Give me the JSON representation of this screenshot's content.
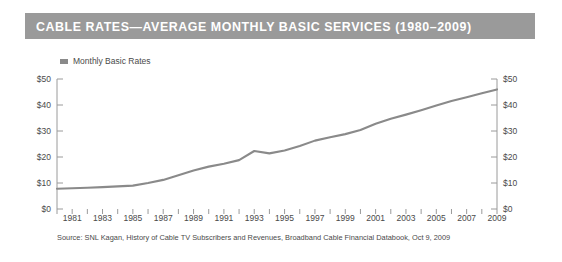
{
  "header": {
    "title": "CABLE RATES—AVERAGE MONTHLY BASIC SERVICES (1980–2009)",
    "band_color": "#9a9a9a",
    "title_color": "#ffffff"
  },
  "legend": {
    "position": "top-left",
    "entries": [
      {
        "label": "Monthly Basic Rates",
        "color": "#8a8a8a",
        "marker": "square"
      }
    ]
  },
  "source": {
    "text": "Source: SNL Kagan, History of Cable TV Subscribers and Revenues, Broadband Cable Financial Databook, Oct 9, 2009"
  },
  "axes": {
    "y_left_ticks": [
      "$50",
      "$40",
      "$30",
      "$20",
      "$10",
      "$0"
    ],
    "y_right_ticks": [
      "$50",
      "$40",
      "$30",
      "$20",
      "$10",
      "$0"
    ],
    "x_labels": [
      "1981",
      "1983",
      "1985",
      "1987",
      "1989",
      "1991",
      "1993",
      "1995",
      "1997",
      "1999",
      "2001",
      "2003",
      "2005",
      "2007",
      "2009"
    ]
  },
  "chart_data": {
    "type": "line",
    "title": "CABLE RATES—AVERAGE MONTHLY BASIC SERVICES (1980–2009)",
    "xlabel": "",
    "ylabel": "",
    "ylim": [
      0,
      50
    ],
    "xlim": [
      1980,
      2009
    ],
    "yticks": [
      0,
      10,
      20,
      30,
      40,
      50
    ],
    "ytick_labels": [
      "$0",
      "$10",
      "$20",
      "$30",
      "$40",
      "$50"
    ],
    "xticks": [
      1980,
      1981,
      1982,
      1983,
      1984,
      1985,
      1986,
      1987,
      1988,
      1989,
      1990,
      1991,
      1992,
      1993,
      1994,
      1995,
      1996,
      1997,
      1998,
      1999,
      2000,
      2001,
      2002,
      2003,
      2004,
      2005,
      2006,
      2007,
      2008,
      2009
    ],
    "xtick_labels_shown": [
      "1981",
      "1983",
      "1985",
      "1987",
      "1989",
      "1991",
      "1993",
      "1995",
      "1997",
      "1999",
      "2001",
      "2003",
      "2005",
      "2007",
      "2009"
    ],
    "grid": false,
    "legend_position": "top-left",
    "line_color": "#8a8a8a",
    "x": [
      1980,
      1981,
      1982,
      1983,
      1984,
      1985,
      1986,
      1987,
      1988,
      1989,
      1990,
      1991,
      1992,
      1993,
      1994,
      1995,
      1996,
      1997,
      1998,
      1999,
      2000,
      2001,
      2002,
      2003,
      2004,
      2005,
      2006,
      2007,
      2008,
      2009
    ],
    "series": [
      {
        "name": "Monthly Basic Rates",
        "values": [
          7.8,
          8.0,
          8.2,
          8.4,
          8.7,
          9.0,
          10.0,
          11.2,
          13.0,
          14.8,
          16.3,
          17.4,
          18.8,
          22.3,
          21.4,
          22.5,
          24.2,
          26.3,
          27.6,
          28.8,
          30.4,
          32.8,
          34.7,
          36.3,
          38.0,
          39.8,
          41.5,
          43.0,
          44.5,
          46.0
        ]
      }
    ]
  }
}
